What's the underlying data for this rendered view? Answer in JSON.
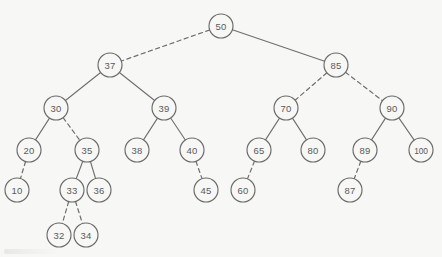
{
  "figure": {
    "name": "binary-search-tree-diagram",
    "background_color": "#f7f7f5",
    "node_fill": "#f7f7f5",
    "node_stroke": "#6a6a6a",
    "edge_color": "#6e6e6e",
    "label_color": "#595959",
    "node_radius": 12
  },
  "chart_data": {
    "type": "diagram",
    "title": "",
    "nodes": [
      {
        "id": "n50",
        "label": "50",
        "x": 221,
        "y": 26,
        "depth": 0
      },
      {
        "id": "n37",
        "label": "37",
        "x": 110,
        "y": 65,
        "depth": 1
      },
      {
        "id": "n85",
        "label": "85",
        "x": 336,
        "y": 65,
        "depth": 1
      },
      {
        "id": "n30",
        "label": "30",
        "x": 56,
        "y": 108,
        "depth": 2
      },
      {
        "id": "n39",
        "label": "39",
        "x": 164,
        "y": 108,
        "depth": 2
      },
      {
        "id": "n70",
        "label": "70",
        "x": 286,
        "y": 108,
        "depth": 2
      },
      {
        "id": "n90",
        "label": "90",
        "x": 392,
        "y": 108,
        "depth": 2
      },
      {
        "id": "n20",
        "label": "20",
        "x": 29,
        "y": 150,
        "depth": 3
      },
      {
        "id": "n35",
        "label": "35",
        "x": 87,
        "y": 150,
        "depth": 3
      },
      {
        "id": "n38",
        "label": "38",
        "x": 137,
        "y": 150,
        "depth": 3
      },
      {
        "id": "n40",
        "label": "40",
        "x": 192,
        "y": 150,
        "depth": 3
      },
      {
        "id": "n65",
        "label": "65",
        "x": 259,
        "y": 150,
        "depth": 3
      },
      {
        "id": "n80",
        "label": "80",
        "x": 313,
        "y": 150,
        "depth": 3
      },
      {
        "id": "n89",
        "label": "89",
        "x": 365,
        "y": 150,
        "depth": 3
      },
      {
        "id": "n100",
        "label": "100",
        "x": 421,
        "y": 150,
        "depth": 3
      },
      {
        "id": "n10",
        "label": "10",
        "x": 17,
        "y": 190,
        "depth": 4
      },
      {
        "id": "n33",
        "label": "33",
        "x": 72,
        "y": 190,
        "depth": 4
      },
      {
        "id": "n36",
        "label": "36",
        "x": 99,
        "y": 190,
        "depth": 4
      },
      {
        "id": "n45",
        "label": "45",
        "x": 206,
        "y": 190,
        "depth": 4
      },
      {
        "id": "n60",
        "label": "60",
        "x": 243,
        "y": 190,
        "depth": 4
      },
      {
        "id": "n87",
        "label": "87",
        "x": 350,
        "y": 190,
        "depth": 4
      },
      {
        "id": "n32",
        "label": "32",
        "x": 59,
        "y": 235,
        "depth": 5
      },
      {
        "id": "n34",
        "label": "34",
        "x": 86,
        "y": 235,
        "depth": 5
      }
    ],
    "edges": [
      {
        "from": "n50",
        "to": "n37",
        "style": "dashed"
      },
      {
        "from": "n50",
        "to": "n85",
        "style": "solid"
      },
      {
        "from": "n37",
        "to": "n30",
        "style": "solid"
      },
      {
        "from": "n37",
        "to": "n39",
        "style": "solid"
      },
      {
        "from": "n85",
        "to": "n70",
        "style": "dashed"
      },
      {
        "from": "n85",
        "to": "n90",
        "style": "dashed"
      },
      {
        "from": "n30",
        "to": "n20",
        "style": "solid"
      },
      {
        "from": "n30",
        "to": "n35",
        "style": "dashed"
      },
      {
        "from": "n39",
        "to": "n38",
        "style": "solid"
      },
      {
        "from": "n39",
        "to": "n40",
        "style": "solid"
      },
      {
        "from": "n70",
        "to": "n65",
        "style": "solid"
      },
      {
        "from": "n70",
        "to": "n80",
        "style": "solid"
      },
      {
        "from": "n90",
        "to": "n89",
        "style": "solid"
      },
      {
        "from": "n90",
        "to": "n100",
        "style": "solid"
      },
      {
        "from": "n20",
        "to": "n10",
        "style": "dashed"
      },
      {
        "from": "n35",
        "to": "n33",
        "style": "solid"
      },
      {
        "from": "n35",
        "to": "n36",
        "style": "solid"
      },
      {
        "from": "n40",
        "to": "n45",
        "style": "dashed"
      },
      {
        "from": "n65",
        "to": "n60",
        "style": "dashed"
      },
      {
        "from": "n89",
        "to": "n87",
        "style": "dashed"
      },
      {
        "from": "n33",
        "to": "n32",
        "style": "dashed"
      },
      {
        "from": "n33",
        "to": "n34",
        "style": "dashed"
      }
    ]
  }
}
